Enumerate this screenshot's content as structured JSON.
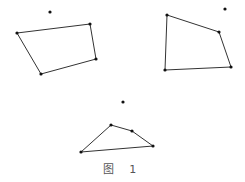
{
  "figure": {
    "caption": "图 1",
    "stroke_color": "#333333",
    "point_color": "#111111",
    "shapes": [
      {
        "name": "left-quadrilateral",
        "vertices": [
          [
            17,
            33
          ],
          [
            90,
            24
          ],
          [
            96,
            59
          ],
          [
            41,
            74
          ]
        ],
        "outside_point": [
          50,
          12
        ]
      },
      {
        "name": "right-quadrilateral",
        "vertices": [
          [
            167,
            15
          ],
          [
            219,
            32
          ],
          [
            231,
            67
          ],
          [
            165,
            70
          ]
        ],
        "outside_point": [
          225,
          9
        ]
      },
      {
        "name": "bottom-quadrilateral",
        "vertices": [
          [
            111,
            125
          ],
          [
            132,
            131
          ],
          [
            153,
            146
          ],
          [
            81,
            152
          ]
        ],
        "outside_point": [
          123,
          102
        ]
      }
    ]
  }
}
